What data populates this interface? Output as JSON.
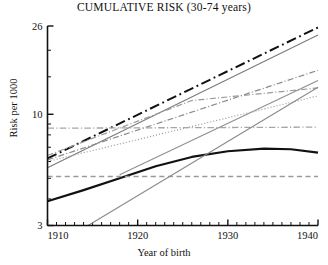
{
  "chart_data": {
    "type": "line",
    "title": "CUMULATIVE RISK (30-74 years)",
    "xlabel": "Year of birth",
    "ylabel": "Risk per 1000",
    "xlim": [
      1910,
      1940
    ],
    "ylim": [
      3,
      26
    ],
    "yscale": "log",
    "xticks": [
      1910,
      1920,
      1930,
      1940
    ],
    "xtick_labels": [
      "1910",
      "1920",
      "1930",
      "1940"
    ],
    "yticks": [
      3,
      10,
      26
    ],
    "ytick_labels": [
      "3",
      "10",
      "26"
    ],
    "yminor_ticks": [
      4,
      5,
      6,
      7,
      8,
      9,
      15,
      20
    ],
    "xminor_step": 1,
    "grid": false,
    "legend": "none",
    "series": [
      {
        "name": "series-1-black-dashdot-steep",
        "color": "#111111",
        "style": "dashdot",
        "width": 2.0,
        "x": [
          1910,
          1940
        ],
        "y": [
          6.2,
          25.6
        ]
      },
      {
        "name": "series-2-gray-solid-steepest",
        "color": "#7a7a7a",
        "style": "solid",
        "width": 1.1,
        "x": [
          1910,
          1940
        ],
        "y": [
          5.6,
          23.6
        ]
      },
      {
        "name": "series-3-gray-dashdot-rising",
        "color": "#8a8a8a",
        "style": "dashdot",
        "width": 1.2,
        "x": [
          1910,
          1940
        ],
        "y": [
          6.1,
          16.1
        ]
      },
      {
        "name": "series-4-gray-dashdot-flattening",
        "color": "#9a9a9a",
        "style": "dashdot",
        "width": 1.2,
        "x": [
          1910,
          1926,
          1940
        ],
        "y": [
          6.4,
          11.6,
          13.3
        ]
      },
      {
        "name": "series-5-gray-solid-steep-late",
        "color": "#8f8f8f",
        "style": "solid",
        "width": 1.1,
        "x": [
          1918,
          1940
        ],
        "y": [
          5.2,
          14.4
        ]
      },
      {
        "name": "series-6-gray-dotted",
        "color": "#9f9f9f",
        "style": "dotted",
        "width": 1.2,
        "x": [
          1910,
          1940
        ],
        "y": [
          6.0,
          12.2
        ]
      },
      {
        "name": "series-7-gray-dashdot-flat",
        "color": "#a6a6a6",
        "style": "dashdot",
        "width": 1.3,
        "x": [
          1910,
          1940
        ],
        "y": [
          8.6,
          8.7
        ]
      },
      {
        "name": "series-8-black-solid-thick-peak",
        "color": "#111111",
        "style": "solid",
        "width": 2.2,
        "x": [
          1910,
          1914,
          1918,
          1922,
          1926,
          1930,
          1934,
          1937,
          1940
        ],
        "y": [
          3.9,
          4.4,
          5.0,
          5.7,
          6.3,
          6.7,
          6.9,
          6.85,
          6.6
        ]
      },
      {
        "name": "series-9-gray-dashed-flat",
        "color": "#9a9a9a",
        "style": "dashed",
        "width": 1.6,
        "x": [
          1910,
          1940
        ],
        "y": [
          5.1,
          5.1
        ]
      },
      {
        "name": "series-10-gray-solid-steepest-late",
        "color": "#8a8a8a",
        "style": "solid",
        "width": 1.1,
        "x": [
          1914.5,
          1940
        ],
        "y": [
          3.0,
          13.4
        ]
      }
    ]
  }
}
